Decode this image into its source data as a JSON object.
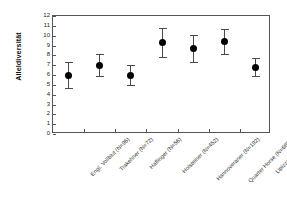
{
  "chart_data": {
    "type": "scatter",
    "title": "",
    "subtitle": "",
    "xlabel": "",
    "ylabel": "Alleldiversität",
    "ylim": [
      0,
      12
    ],
    "ytick_values": [
      0,
      1,
      2,
      3,
      4,
      5,
      6,
      7,
      8,
      9,
      10,
      11,
      12
    ],
    "ytick_labels": [
      "0",
      "1",
      "2",
      "3",
      "4",
      "5",
      "6",
      "7",
      "8",
      "9",
      "10",
      "11",
      "12"
    ],
    "grid": false,
    "legend": null,
    "error_bar_style": "symmetric-with-caps",
    "marker_style": "filled-circle",
    "marker_color": "#000000",
    "error_color": "#4a4a4a",
    "axis_color": "#555555",
    "categories": [
      "Engl. Vollblut (N=96)",
      "Trakehner (N=72)",
      "Haflinger (N=56)",
      "Holsteiner (N=452)",
      "Hannoveraner (N=192)",
      "Quarter Horse (N=6850)",
      "Lipizzaner (N=361)"
    ],
    "values": [
      6.0,
      7.0,
      6.0,
      9.3,
      8.7,
      9.4,
      6.8
    ],
    "errors": [
      1.3,
      1.1,
      1.0,
      1.5,
      1.4,
      1.3,
      0.9
    ],
    "points": [
      {
        "category": "Engl. Vollblut (N=96)",
        "value": 6.0,
        "error": 1.3,
        "low": 4.7,
        "high": 7.3
      },
      {
        "category": "Trakehner (N=72)",
        "value": 7.0,
        "error": 1.1,
        "low": 5.9,
        "high": 8.1
      },
      {
        "category": "Haflinger (N=56)",
        "value": 6.0,
        "error": 1.0,
        "low": 5.0,
        "high": 7.0
      },
      {
        "category": "Holsteiner (N=452)",
        "value": 9.3,
        "error": 1.5,
        "low": 7.8,
        "high": 10.8
      },
      {
        "category": "Hannoveraner (N=192)",
        "value": 8.7,
        "error": 1.4,
        "low": 7.3,
        "high": 10.1
      },
      {
        "category": "Quarter Horse (N=6850)",
        "value": 9.4,
        "error": 1.3,
        "low": 8.1,
        "high": 10.7
      },
      {
        "category": "Lipizzaner (N=361)",
        "value": 6.8,
        "error": 0.9,
        "low": 5.9,
        "high": 7.7
      }
    ]
  }
}
